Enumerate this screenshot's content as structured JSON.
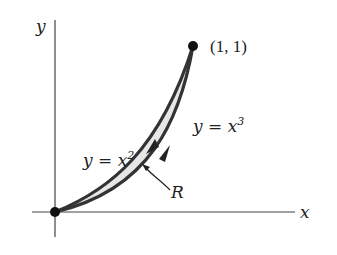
{
  "diagram": {
    "axes": {
      "x_label": "x",
      "y_label": "y"
    },
    "point_label": "(1, 1)",
    "curve_upper": {
      "label_prefix": "y = x",
      "exponent": "2",
      "equation": "y = x^2"
    },
    "curve_lower": {
      "label_prefix": "y = x",
      "exponent": "3",
      "equation": "y = x^3"
    },
    "region_label": "R",
    "colors": {
      "curve": "#333333",
      "region_fill": "#e6e6e6",
      "axis": "#444444"
    }
  }
}
